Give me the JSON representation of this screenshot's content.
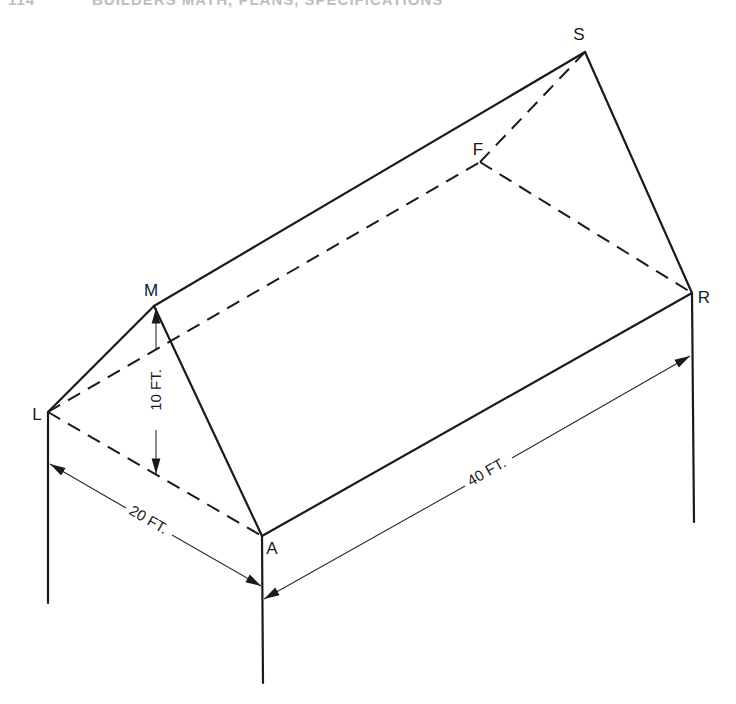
{
  "header": {
    "page_number": "114",
    "title": "BUILDERS MATH, PLANS, SPECIFICATIONS"
  },
  "figure": {
    "vertices": {
      "S": "S",
      "F": "F",
      "R": "R",
      "M": "M",
      "L": "L",
      "A": "A"
    },
    "dimensions": {
      "rise": "10 FT.",
      "span": "20 FT.",
      "length": "40 FT."
    },
    "colors": {
      "line": "#1a1a1a",
      "background": "#ffffff"
    }
  }
}
